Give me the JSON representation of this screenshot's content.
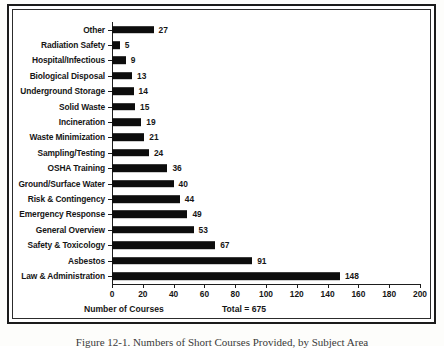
{
  "chart_data": {
    "type": "bar",
    "orientation": "horizontal",
    "title": "",
    "xlabel": "Number of Courses",
    "ylabel": "",
    "xlim": [
      0,
      200
    ],
    "xticks": [
      0,
      20,
      40,
      60,
      80,
      100,
      120,
      140,
      160,
      180,
      200
    ],
    "grid": false,
    "legend": null,
    "annotation": "Total = 675",
    "bar_color": "#0d0d0d",
    "categories": [
      "Other",
      "Radiation Safety",
      "Hospital/Infectious",
      "Biological Disposal",
      "Underground Storage",
      "Solid Waste",
      "Incineration",
      "Waste Minimization",
      "Sampling/Testing",
      "OSHA Training",
      "Ground/Surface Water",
      "Risk & Contingency",
      "Emergency Response",
      "General Overview",
      "Safety & Toxicology",
      "Asbestos",
      "Law & Administration"
    ],
    "values": [
      27,
      5,
      9,
      13,
      14,
      15,
      19,
      21,
      24,
      36,
      40,
      44,
      49,
      53,
      67,
      91,
      148
    ],
    "value_labels": [
      "27",
      "5",
      "9",
      "13",
      "14",
      "15",
      "19",
      "21",
      "24",
      "36",
      "40",
      "44",
      "49",
      "53",
      "67",
      "91",
      "148"
    ]
  },
  "figure": {
    "caption": "Figure 12-1.  Numbers of Short Courses Provided, by Subject Area",
    "xaxis_title": "Number of Courses",
    "total_label": "Total = 675"
  }
}
